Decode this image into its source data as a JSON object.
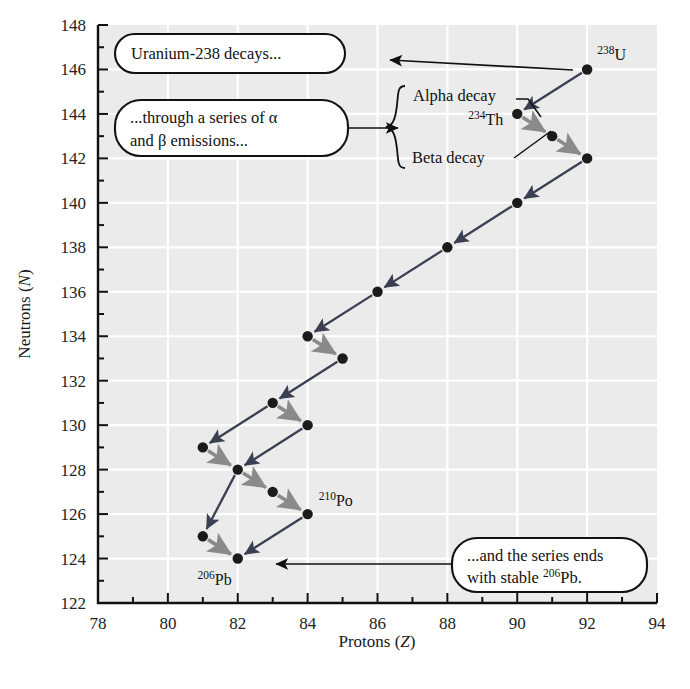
{
  "figure": {
    "background_color": "#ffffff",
    "plot_background_color": "#ebebeb",
    "gridline_color": "#ffffff",
    "axis_color": "#111111"
  },
  "chart_data": {
    "type": "scatter",
    "title": "",
    "xlabel": "Protons (Z)",
    "ylabel": "Neutrons (N)",
    "xlim": [
      78,
      94
    ],
    "ylim": [
      122,
      148
    ],
    "xticks": [
      78,
      80,
      82,
      84,
      86,
      88,
      90,
      92,
      94
    ],
    "xtick_labels": [
      "78",
      "80",
      "82",
      "84",
      "86",
      "88",
      "90",
      "92",
      "94"
    ],
    "yticks": [
      122,
      124,
      126,
      128,
      130,
      132,
      134,
      136,
      138,
      140,
      142,
      144,
      146,
      148
    ],
    "ytick_labels": [
      "122",
      "124",
      "126",
      "128",
      "130",
      "132",
      "134",
      "136",
      "138",
      "140",
      "142",
      "144",
      "146",
      "148"
    ],
    "xtick_minor_step": 1,
    "ytick_minor_step": 1,
    "grid": true,
    "grid_step": 2,
    "legend_position": "none",
    "point_color": "#1b1b1b",
    "point_radius": 5.2,
    "alpha_arrow_color": "#3a3f52",
    "beta_arrow_color": "#8a8a8a",
    "nuclides": [
      {
        "id": "U238",
        "Z": 92,
        "N": 146,
        "label": "U",
        "mass": "238",
        "show_label": true
      },
      {
        "id": "Th234",
        "Z": 90,
        "N": 144,
        "label": "Th",
        "mass": "234",
        "show_label": true
      },
      {
        "id": "Pa234",
        "Z": 91,
        "N": 143,
        "label": "",
        "mass": "",
        "show_label": false
      },
      {
        "id": "U234",
        "Z": 92,
        "N": 142,
        "label": "",
        "mass": "",
        "show_label": false
      },
      {
        "id": "Th230",
        "Z": 90,
        "N": 140,
        "label": "",
        "mass": "",
        "show_label": false
      },
      {
        "id": "Ra226",
        "Z": 88,
        "N": 138,
        "label": "",
        "mass": "",
        "show_label": false
      },
      {
        "id": "Rn222",
        "Z": 86,
        "N": 136,
        "label": "",
        "mass": "",
        "show_label": false
      },
      {
        "id": "Po218",
        "Z": 84,
        "N": 134,
        "label": "",
        "mass": "",
        "show_label": false
      },
      {
        "id": "At218",
        "Z": 85,
        "N": 133,
        "label": "",
        "mass": "",
        "show_label": false
      },
      {
        "id": "Bi214",
        "Z": 83,
        "N": 131,
        "label": "",
        "mass": "",
        "show_label": false
      },
      {
        "id": "Po214",
        "Z": 84,
        "N": 130,
        "label": "",
        "mass": "",
        "show_label": false
      },
      {
        "id": "Tl210",
        "Z": 81,
        "N": 129,
        "label": "",
        "mass": "",
        "show_label": false
      },
      {
        "id": "Pb210",
        "Z": 82,
        "N": 128,
        "label": "",
        "mass": "",
        "show_label": false
      },
      {
        "id": "Bi210",
        "Z": 83,
        "N": 127,
        "label": "",
        "mass": "",
        "show_label": false
      },
      {
        "id": "Po210",
        "Z": 84,
        "N": 126,
        "label": "Po",
        "mass": "210",
        "show_label": true
      },
      {
        "id": "Tl206",
        "Z": 81,
        "N": 125,
        "label": "",
        "mass": "",
        "show_label": false
      },
      {
        "id": "Pb206",
        "Z": 82,
        "N": 124,
        "label": "Pb",
        "mass": "206",
        "show_label": true
      }
    ],
    "decays": [
      {
        "from": [
          92,
          146
        ],
        "to": [
          90,
          144
        ],
        "type": "alpha"
      },
      {
        "from": [
          90,
          144
        ],
        "to": [
          91,
          143
        ],
        "type": "beta"
      },
      {
        "from": [
          91,
          143
        ],
        "to": [
          92,
          142
        ],
        "type": "beta"
      },
      {
        "from": [
          92,
          142
        ],
        "to": [
          90,
          140
        ],
        "type": "alpha"
      },
      {
        "from": [
          90,
          140
        ],
        "to": [
          88,
          138
        ],
        "type": "alpha"
      },
      {
        "from": [
          88,
          138
        ],
        "to": [
          86,
          136
        ],
        "type": "alpha"
      },
      {
        "from": [
          86,
          136
        ],
        "to": [
          84,
          134
        ],
        "type": "alpha"
      },
      {
        "from": [
          84,
          134
        ],
        "to": [
          85,
          133
        ],
        "type": "beta"
      },
      {
        "from": [
          85,
          133
        ],
        "to": [
          83,
          131
        ],
        "type": "alpha"
      },
      {
        "from": [
          83,
          131
        ],
        "to": [
          84,
          130
        ],
        "type": "beta"
      },
      {
        "from": [
          84,
          130
        ],
        "to": [
          82,
          128
        ],
        "type": "alpha"
      },
      {
        "from": [
          82,
          128
        ],
        "to": [
          83,
          127
        ],
        "type": "beta"
      },
      {
        "from": [
          83,
          127
        ],
        "to": [
          84,
          126
        ],
        "type": "beta"
      },
      {
        "from": [
          84,
          126
        ],
        "to": [
          82,
          124
        ],
        "type": "alpha"
      },
      {
        "from": [
          83,
          131
        ],
        "to": [
          81,
          129
        ],
        "type": "alpha"
      },
      {
        "from": [
          81,
          129
        ],
        "to": [
          82,
          128
        ],
        "type": "beta"
      },
      {
        "from": [
          82,
          128
        ],
        "to": [
          81,
          125
        ],
        "type": "alpha"
      },
      {
        "from": [
          81,
          125
        ],
        "to": [
          82,
          124
        ],
        "type": "beta"
      }
    ]
  },
  "callouts": [
    {
      "id": "uranium-decays",
      "lines": [
        "Uranium-238 decays..."
      ],
      "target": [
        92,
        146
      ]
    },
    {
      "id": "series-emissions",
      "lines": [
        "...through a series of α",
        "and β emissions..."
      ],
      "target": null
    },
    {
      "id": "series-ends",
      "lines": [
        "...and the series ends",
        "with stable ¹⁰⁶Pb."
      ],
      "line1": "...and the series ends",
      "line2_pre": "with stable ",
      "line2_sup": "206",
      "line2_post": "Pb.",
      "target": [
        82,
        124
      ]
    }
  ],
  "decay_legend": {
    "alpha_label": "Alpha decay",
    "beta_label": "Beta decay"
  },
  "caption": {
    "text": ""
  }
}
